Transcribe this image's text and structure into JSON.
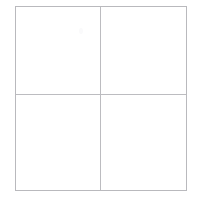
{
  "page": {
    "title": "",
    "background_color": "#ffffff",
    "width": 200,
    "height": 206
  },
  "grid": {
    "name": "empty-2x2-grid",
    "rows": 2,
    "columns": 2,
    "border_color": "#b9b9bd",
    "divider_color": "#bcbcc0",
    "cell_background": "#ffffff",
    "frame": {
      "left": 15,
      "top": 6,
      "width": 172,
      "height": 185
    },
    "cells": [
      {
        "id": "r0c0",
        "row": 0,
        "column": 0,
        "text": ""
      },
      {
        "id": "r0c1",
        "row": 0,
        "column": 1,
        "text": ""
      },
      {
        "id": "r1c0",
        "row": 1,
        "column": 0,
        "text": ""
      },
      {
        "id": "r1c1",
        "row": 1,
        "column": 1,
        "text": ""
      }
    ]
  },
  "artifacts": {
    "faint_mark_color": "#fafafb"
  }
}
